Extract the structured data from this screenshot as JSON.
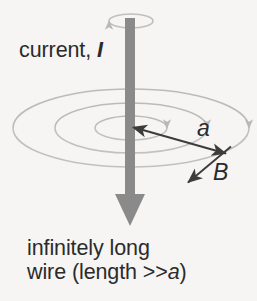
{
  "figure": {
    "background_color": "#f6f5f3",
    "wire_color": "#8a8a8a",
    "field_line_color": "#b9b8b6",
    "text_color": "#2b2b2b",
    "arrow_color": "#3c3c3c"
  },
  "labels": {
    "current": {
      "text": "current,",
      "symbol": "I",
      "icon": "current-label"
    },
    "radius": {
      "symbol": "a",
      "icon": "radius-label"
    },
    "field": {
      "symbol": "B",
      "icon": "magnetic-field-label"
    },
    "caption": {
      "line1": "infinitely long",
      "line2_prefix": "wire (length >>",
      "line2_symbol": "a",
      "line2_suffix": ")"
    }
  },
  "diagram_data": {
    "type": "schematic",
    "wire": {
      "name": "current-carrying-wire",
      "orientation": "vertical",
      "current_direction": "downward",
      "x": 130,
      "top_y": 18,
      "bottom_y": 226,
      "width": 10,
      "arrowhead_width": 30,
      "arrowhead_top_y": 194
    },
    "field_center": {
      "x": 131,
      "y": 128
    },
    "field_lines": [
      {
        "name": "field-line-inner",
        "rx": 36,
        "ry": 12
      },
      {
        "name": "field-line-middle",
        "rx": 76,
        "ry": 25
      },
      {
        "name": "field-line-outer",
        "rx": 118,
        "ry": 39
      }
    ],
    "top_circulation": {
      "name": "current-circulation-indicator",
      "cx": 131,
      "cy": 21,
      "rx": 22,
      "ry": 7
    },
    "radius_arrow": {
      "name": "radius-arrow",
      "from": {
        "x": 132,
        "y": 127
      },
      "to": {
        "x": 228,
        "y": 154
      },
      "double_headed": true
    },
    "field_arrow": {
      "name": "magnetic-field-arrow",
      "from": {
        "x": 231,
        "y": 147
      },
      "to": {
        "x": 186,
        "y": 184
      },
      "double_headed": false
    }
  }
}
